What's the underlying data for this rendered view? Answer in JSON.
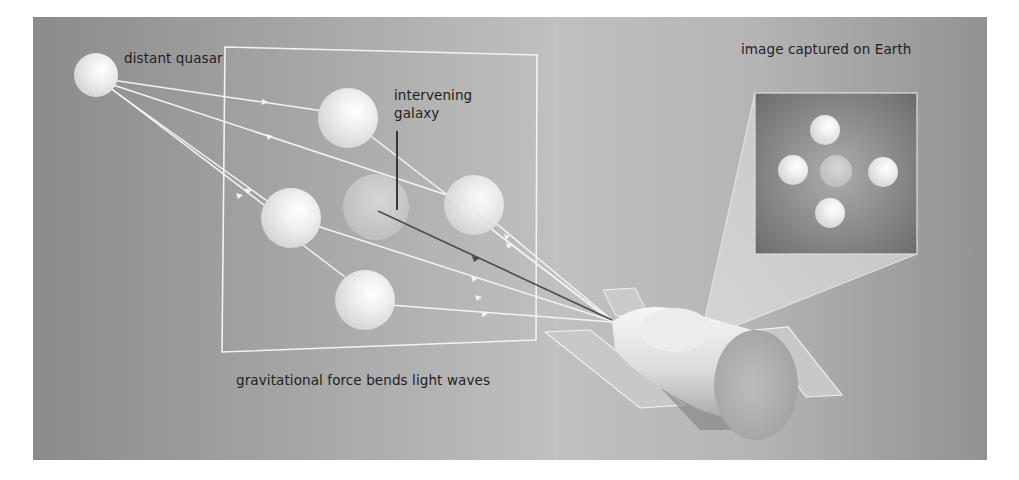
{
  "diagram": {
    "type": "illustration",
    "labels": {
      "source": "distant quasar",
      "lens_line1": "intervening",
      "lens_line2": "galaxy",
      "observed": "image captured on Earth",
      "caption": "gravitational force bends light waves"
    },
    "colors": {
      "background_dark": "#8a8a8a",
      "background_light": "#c2c2c2",
      "inset_dark": "#6e6e6e",
      "inset_light": "#a9a9a9",
      "ray": "#f4f4f4",
      "galaxy_ray": "#4a4a4a",
      "text": "#1e1e1e"
    },
    "components": [
      "distant-quasar",
      "lens-plane",
      "intervening-galaxy",
      "lensed-images (4)",
      "light-rays",
      "space-telescope",
      "observed-image-inset (5 spots)"
    ]
  }
}
